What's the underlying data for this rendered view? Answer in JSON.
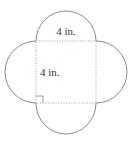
{
  "figure": {
    "type": "square with four semicircles on each side",
    "labels": {
      "top_side": "4 in.",
      "left_side": "4 in."
    },
    "right_angle_marker": true,
    "colors": {
      "outline": "#8a8a8a",
      "dotted": "#9a9a9a",
      "text": "#333333"
    }
  }
}
